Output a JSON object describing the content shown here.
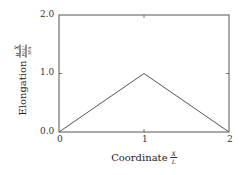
{
  "chart_data": {
    "type": "line",
    "title": "",
    "xlabel": "Coordinate X/L",
    "ylabel": "Elongation u_X / (P0 L^2 / 3EA)",
    "xlim": [
      0,
      2
    ],
    "ylim": [
      0.0,
      2.0
    ],
    "xticks": [
      "0",
      "1",
      "2"
    ],
    "yticks": [
      "0.0",
      "1.0",
      "2.0"
    ],
    "grid": false,
    "legend": null,
    "series": [
      {
        "name": "elongation",
        "x": [
          0,
          1,
          2
        ],
        "y": [
          0.0,
          1.0,
          0.0
        ],
        "color": "#555555"
      }
    ]
  },
  "axis": {
    "xlabel_text": "Coordinate",
    "xlabel_num": "X",
    "xlabel_den": "L",
    "ylabel_text": "Elongation",
    "ylabel_num": "u_X",
    "ylabel_den_top": "P0 L²",
    "ylabel_den_bot": "3EA",
    "xtick_0": "0",
    "xtick_1": "1",
    "xtick_2": "2",
    "ytick_0": "0.0",
    "ytick_1": "1.0",
    "ytick_2": "2.0"
  }
}
